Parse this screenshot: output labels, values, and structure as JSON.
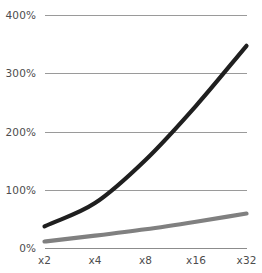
{
  "chart_data": {
    "type": "line",
    "title": "",
    "subtitle": "",
    "xlabel": "",
    "ylabel": "",
    "x": [
      "x2",
      "x4",
      "x8",
      "x16",
      "x32"
    ],
    "categories": [
      "x2",
      "x4",
      "x8",
      "x16",
      "x32"
    ],
    "xtick_labels": [
      "x2",
      "x4",
      "x8",
      "x16",
      "x32"
    ],
    "ytick_labels": [
      "0%",
      "100%",
      "200%",
      "300%",
      "400%"
    ],
    "ytick_values": [
      0,
      100,
      200,
      300,
      400
    ],
    "ylim": [
      0,
      400
    ],
    "grid": true,
    "grid_axis": "y",
    "legend": false,
    "legend_position": "none",
    "annotations": [],
    "series": [
      {
        "name": "series-dark",
        "color": "#1f1f1f",
        "stroke_width": 4.2,
        "values": [
          38,
          78,
          152,
          245,
          348
        ]
      },
      {
        "name": "series-gray",
        "color": "#808080",
        "stroke_width": 4.2,
        "values": [
          12,
          22,
          33,
          46,
          60
        ]
      }
    ]
  },
  "axis": {
    "y_unit": "%",
    "x_scale": "log2"
  },
  "colors": {
    "background": "#ffffff",
    "gridline": "#9a9a9a",
    "axisline": "#8c8c8c",
    "tick_text": "#4d4d4d",
    "series_dark": "#1f1f1f",
    "series_gray": "#808080"
  }
}
